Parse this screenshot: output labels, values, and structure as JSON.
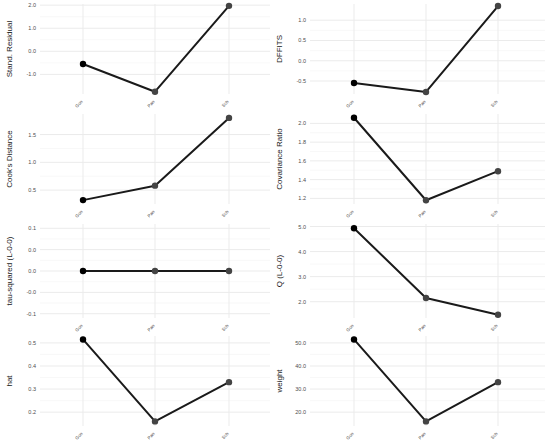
{
  "chart_data": [
    {
      "type": "line",
      "panel": "top-left",
      "title": "",
      "xlabel": "",
      "ylabel": "Stand. Residual",
      "categories": [
        "Gon",
        "Pan",
        "Sch"
      ],
      "values": [
        -0.55,
        -1.75,
        1.97
      ],
      "yticks": [
        -1.0,
        0.0,
        1.0,
        2.0
      ],
      "ytick_labels": [
        "-1.0",
        "0.0",
        "1.0",
        "2.0"
      ],
      "ylim": [
        -1.85,
        2.05
      ],
      "grid": true
    },
    {
      "type": "line",
      "panel": "top-right",
      "title": "",
      "xlabel": "",
      "ylabel": "DFFITS",
      "categories": [
        "Gon",
        "Pan",
        "Sch"
      ],
      "values": [
        -0.55,
        -0.77,
        1.35
      ],
      "yticks": [
        -0.5,
        0.0,
        0.5,
        1.0
      ],
      "ytick_labels": [
        "-0.5",
        "0.0",
        "0.5",
        "1.0"
      ],
      "ylim": [
        -0.82,
        1.4
      ],
      "grid": true
    },
    {
      "type": "line",
      "panel": "row2-left",
      "title": "",
      "xlabel": "",
      "ylabel": "Cook's Distance",
      "categories": [
        "Gon",
        "Pan",
        "Sch"
      ],
      "values": [
        0.32,
        0.58,
        1.8
      ],
      "yticks": [
        0.5,
        1.0,
        1.5
      ],
      "ytick_labels": [
        "0.5",
        "1.0",
        "1.5"
      ],
      "ylim": [
        0.25,
        1.87
      ],
      "grid": true
    },
    {
      "type": "line",
      "panel": "row2-right",
      "title": "",
      "xlabel": "",
      "ylabel": "Covariance Ratio",
      "categories": [
        "Gon",
        "Pan",
        "Sch"
      ],
      "values": [
        2.06,
        1.18,
        1.49
      ],
      "yticks": [
        1.2,
        1.4,
        1.6,
        1.8,
        2.0
      ],
      "ytick_labels": [
        "1.2",
        "1.4",
        "1.6",
        "1.8",
        "2.0"
      ],
      "ylim": [
        1.14,
        2.1
      ],
      "grid": true
    },
    {
      "type": "line",
      "panel": "row3-left",
      "title": "",
      "xlabel": "",
      "ylabel": "tau-squared (L-0-0)",
      "categories": [
        "Gon",
        "Pan",
        "Sch"
      ],
      "values": [
        0.0,
        0.0,
        0.0
      ],
      "yticks": [
        -0.1,
        -0.05,
        0.0,
        0.05,
        0.1
      ],
      "ytick_labels": [
        "-0.1",
        "-0.0",
        "0.0",
        "0.0",
        "0.1"
      ],
      "ylim": [
        -0.11,
        0.11
      ],
      "grid": true
    },
    {
      "type": "line",
      "panel": "row3-right",
      "title": "",
      "xlabel": "",
      "ylabel": "Q (L-0-0)",
      "categories": [
        "Gon",
        "Pan",
        "Sch"
      ],
      "values": [
        4.93,
        2.15,
        1.48
      ],
      "yticks": [
        2.0,
        3.0,
        4.0,
        5.0
      ],
      "ytick_labels": [
        "2.0",
        "3.0",
        "4.0",
        "5.0"
      ],
      "ylim": [
        1.35,
        5.1
      ],
      "grid": true
    },
    {
      "type": "line",
      "panel": "bottom-left",
      "title": "",
      "xlabel": "",
      "ylabel": "hat",
      "categories": [
        "Gon",
        "Pan",
        "Sch"
      ],
      "values": [
        0.515,
        0.16,
        0.33
      ],
      "yticks": [
        0.2,
        0.3,
        0.4,
        0.5
      ],
      "ytick_labels": [
        "0.2",
        "0.3",
        "0.4",
        "0.5"
      ],
      "ylim": [
        0.14,
        0.53
      ],
      "grid": true
    },
    {
      "type": "line",
      "panel": "bottom-right",
      "title": "",
      "xlabel": "",
      "ylabel": "weight",
      "categories": [
        "Gon",
        "Pan",
        "Sch"
      ],
      "values": [
        51.5,
        16.0,
        33.0
      ],
      "yticks": [
        20.0,
        30.0,
        40.0,
        50.0
      ],
      "ytick_labels": [
        "20.0",
        "30.0",
        "40.0",
        "50.0"
      ],
      "ylim": [
        14.0,
        53.0
      ],
      "grid": true
    }
  ],
  "style": {
    "line_color": "#1a1a1a",
    "first_point_color": "#000000",
    "point_color": "#444444",
    "grid_color": "#ebebeb",
    "tick_label_color": "#4d4d4d",
    "axis_label_color": "#1a1a1a"
  }
}
